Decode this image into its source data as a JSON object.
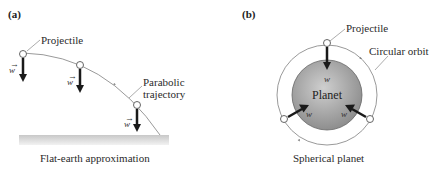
{
  "panel_a": {
    "label": "(a)",
    "projectile_label": "Projectile",
    "trajectory_label_1": "Parabolic",
    "trajectory_label_2": "trajectory",
    "weight_symbol": "w",
    "caption": "Flat-earth approximation"
  },
  "panel_b": {
    "label": "(b)",
    "projectile_label": "Projectile",
    "orbit_label": "Circular orbit",
    "planet_label": "Planet",
    "weight_symbol": "w",
    "caption": "Spherical planet"
  },
  "colors": {
    "planet_center": "#c9c9c9",
    "planet_edge": "#8a8a8a",
    "ground": "#d4d4d4",
    "arrow": "#1a1a1a",
    "trajectory": "#9a9a9a"
  }
}
